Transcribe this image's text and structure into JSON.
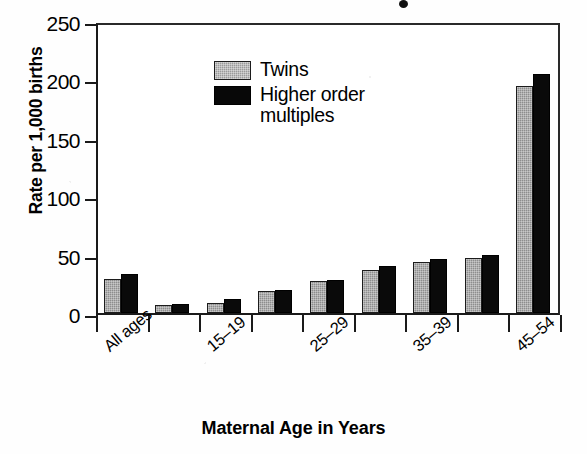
{
  "chart_data": {
    "type": "bar",
    "title": "",
    "xlabel": "Maternal Age in Years",
    "ylabel": "Rate per 1,000 births",
    "ylim": [
      0,
      250
    ],
    "yticks": [
      0,
      50,
      100,
      150,
      200,
      250
    ],
    "grid": false,
    "legend_position": "top-left",
    "categories": [
      "All ages",
      "",
      "15–19",
      "",
      "25–29",
      "",
      "35–39",
      "",
      "45–54"
    ],
    "tick_labels": [
      "All ages",
      "15–19",
      "25–29",
      "35–39",
      "45–54"
    ],
    "series": [
      {
        "name": "Twins",
        "color": "#8d8d8d",
        "values": [
          29,
          7,
          9,
          19,
          27,
          37,
          44,
          47,
          194
        ]
      },
      {
        "name": "Higher order multiples",
        "color": "#0a0a0a",
        "values": [
          33,
          8,
          12,
          20,
          28,
          40,
          46,
          50,
          205
        ]
      }
    ]
  },
  "axes": {
    "y_title": "Rate per 1,000 births",
    "x_title": "Maternal Age in Years",
    "y_tick_labels": [
      "250",
      "200",
      "150",
      "100",
      "50",
      "0"
    ]
  },
  "legend": {
    "items": [
      {
        "label": "Twins",
        "swatch": "gray-hatched-swatch"
      },
      {
        "label": "Higher order\nmultiples",
        "label_line1": "Higher order",
        "label_line2": "multiples",
        "swatch": "black-swatch"
      }
    ]
  }
}
